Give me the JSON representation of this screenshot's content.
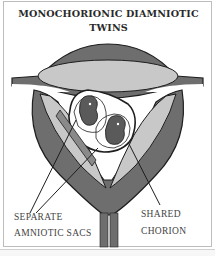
{
  "figure": {
    "title_line1": "MONOCHORIONIC DIAMNIOTIC",
    "title_line2": "TWINS",
    "labels": {
      "separate_line1": "SEPARATE",
      "separate_line2": "AMNIOTIC SACS",
      "shared_line1": "SHARED",
      "shared_line2": "CHORION"
    },
    "colors": {
      "dark_wall": "#6e6e6e",
      "light_fill": "#c8c8c8",
      "outline": "#1e1e1e",
      "fetus": "#5a5a5a"
    }
  }
}
